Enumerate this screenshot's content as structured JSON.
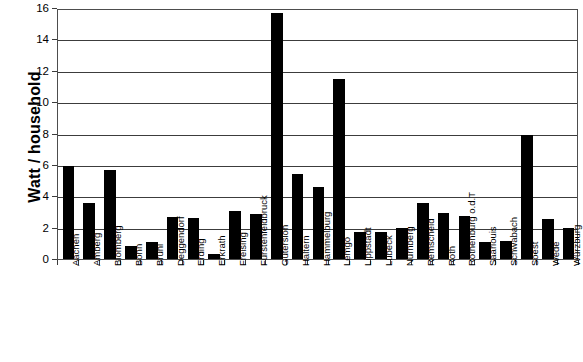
{
  "chart_data": {
    "type": "bar",
    "title": "",
    "xlabel": "",
    "ylabel": "Watt / household",
    "ylim": [
      0,
      16
    ],
    "yticks": [
      0,
      2,
      4,
      6,
      8,
      10,
      12,
      14,
      16
    ],
    "grid": true,
    "legend": false,
    "bar_color": "#000000",
    "axis_color": "#3c3c3c",
    "categories": [
      "Aachen",
      "Amberg",
      "Blomberg",
      "Bonn",
      "Brühl",
      "Deggendorf",
      "Erding",
      "Erkrath",
      "Freising",
      "Fürstenfeldbruck",
      "Gütersloh",
      "Haltern",
      "Hammelburg",
      "Lemgo",
      "Lippstadt",
      "Lübeck",
      "Nürnberg",
      "Remscheid",
      "Roth",
      "Rothenburg o.d.T",
      "Saarlouis",
      "Schwabach",
      "Soest",
      "Wede",
      "Würzburg"
    ],
    "values": [
      5.95,
      3.55,
      5.7,
      0.85,
      1.1,
      2.65,
      2.6,
      0.3,
      3.05,
      2.85,
      15.7,
      5.45,
      4.6,
      11.5,
      1.7,
      1.75,
      2.0,
      3.55,
      2.95,
      2.75,
      1.1,
      1.15,
      7.9,
      2.55,
      1.95
    ]
  }
}
